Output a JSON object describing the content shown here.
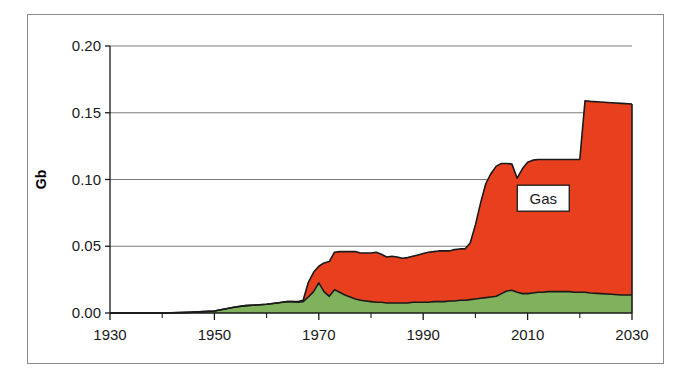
{
  "chart_data": {
    "type": "area",
    "stacked": true,
    "title": "",
    "subtitle": "",
    "xlabel": "",
    "ylabel": "Gb",
    "xlim": [
      1930,
      2030
    ],
    "ylim": [
      0.0,
      0.2
    ],
    "grid": "horizontal",
    "legend_position": "inline-annotation",
    "x_tick_labels": [
      "1930",
      "1950",
      "1970",
      "1990",
      "2010",
      "2030"
    ],
    "x_tick_values": [
      1930,
      1950,
      1970,
      1990,
      2010,
      2030
    ],
    "x_minor_tick_values": [
      1940,
      1960,
      1980,
      2000,
      2020
    ],
    "y_tick_labels": [
      "0.00",
      "0.05",
      "0.10",
      "0.15",
      "0.20"
    ],
    "y_tick_values": [
      0.0,
      0.05,
      0.1,
      0.15,
      0.2
    ],
    "annotations": [
      {
        "text": "Gas",
        "x": 2013,
        "y": 0.086,
        "boxed": true
      }
    ],
    "colors": {
      "series_lower": "#80b25e",
      "series_upper": "#e8401f",
      "outline": "#1a1a1a",
      "gridline": "#7a7a7a",
      "axis": "#1a1a1a",
      "frame": "#8b8b8b",
      "background": "#ffffff"
    },
    "x": [
      1930,
      1935,
      1940,
      1945,
      1948,
      1950,
      1952,
      1954,
      1956,
      1958,
      1960,
      1962,
      1963,
      1964,
      1965,
      1966,
      1967,
      1968,
      1969,
      1970,
      1971,
      1972,
      1973,
      1974,
      1975,
      1976,
      1977,
      1978,
      1979,
      1980,
      1981,
      1982,
      1983,
      1984,
      1985,
      1986,
      1987,
      1988,
      1989,
      1990,
      1991,
      1992,
      1993,
      1994,
      1995,
      1996,
      1997,
      1998,
      1999,
      2000,
      2001,
      2002,
      2003,
      2004,
      2005,
      2006,
      2007,
      2008,
      2009,
      2010,
      2011,
      2012,
      2013,
      2014,
      2015,
      2016,
      2017,
      2018,
      2019,
      2020,
      2021,
      2022,
      2024,
      2026,
      2028,
      2030
    ],
    "series": [
      {
        "name": "lower-green",
        "values": [
          0.0,
          0.0,
          0.0,
          0.0005,
          0.001,
          0.0015,
          0.003,
          0.0045,
          0.0055,
          0.006,
          0.0065,
          0.0075,
          0.008,
          0.0085,
          0.0085,
          0.008,
          0.0085,
          0.012,
          0.016,
          0.0225,
          0.016,
          0.0125,
          0.0175,
          0.0155,
          0.0135,
          0.012,
          0.0105,
          0.0095,
          0.009,
          0.0085,
          0.008,
          0.008,
          0.0075,
          0.0075,
          0.0075,
          0.0075,
          0.0075,
          0.008,
          0.008,
          0.008,
          0.008,
          0.0085,
          0.0085,
          0.0085,
          0.009,
          0.009,
          0.0095,
          0.0095,
          0.01,
          0.0105,
          0.011,
          0.0115,
          0.012,
          0.0125,
          0.0145,
          0.0165,
          0.017,
          0.0155,
          0.0145,
          0.0145,
          0.015,
          0.0155,
          0.0155,
          0.016,
          0.016,
          0.016,
          0.016,
          0.016,
          0.0155,
          0.0155,
          0.0155,
          0.015,
          0.0145,
          0.014,
          0.0135,
          0.0135
        ],
        "label": ""
      },
      {
        "name": "upper-red-gas",
        "values": [
          0.0,
          0.0,
          0.0,
          0.0,
          0.0,
          0.0,
          0.0,
          0.0,
          0.0,
          0.0,
          0.0,
          0.0,
          0.0,
          0.0,
          0.0,
          0.0005,
          0.001,
          0.011,
          0.0145,
          0.0125,
          0.0215,
          0.026,
          0.028,
          0.0305,
          0.0325,
          0.034,
          0.0355,
          0.0355,
          0.036,
          0.0365,
          0.0375,
          0.036,
          0.0345,
          0.035,
          0.0345,
          0.0335,
          0.034,
          0.0345,
          0.0355,
          0.0365,
          0.0375,
          0.0375,
          0.038,
          0.038,
          0.0375,
          0.0385,
          0.0385,
          0.0385,
          0.0425,
          0.0555,
          0.0715,
          0.0855,
          0.0925,
          0.0975,
          0.0975,
          0.0955,
          0.0945,
          0.0855,
          0.0935,
          0.0985,
          0.0995,
          0.0995,
          0.0995,
          0.099,
          0.099,
          0.099,
          0.099,
          0.099,
          0.0995,
          0.0995,
          0.1435,
          0.1435,
          0.1435,
          0.1435,
          0.1435,
          0.143
        ],
        "label": "Gas"
      }
    ],
    "series_totals_note": "upper values are increments stacked on top of lower-green"
  },
  "figure": {
    "frame_visible": true
  }
}
